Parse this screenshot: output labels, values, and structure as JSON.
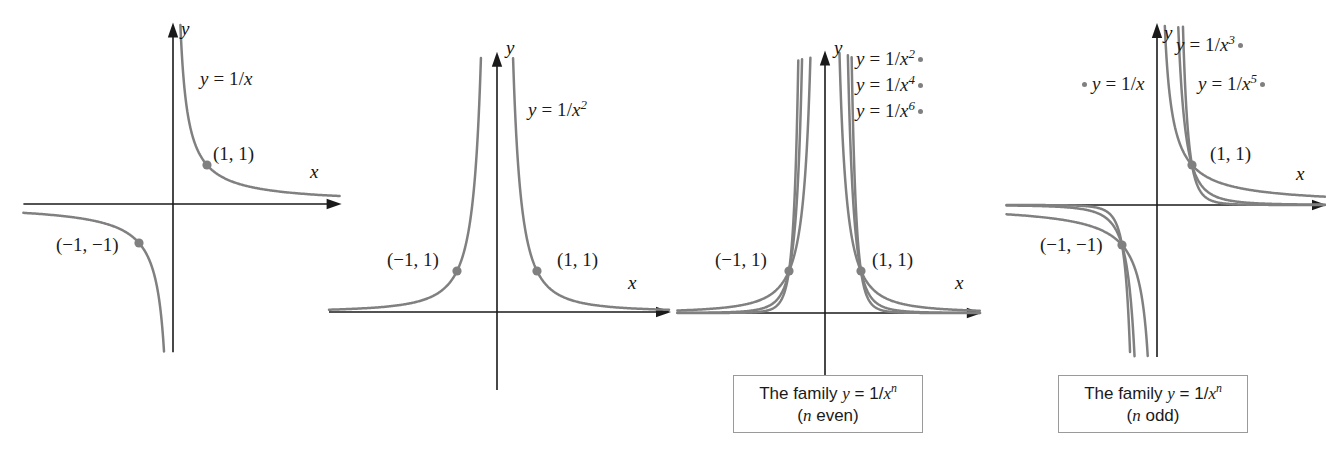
{
  "figure": {
    "background_color": "#ffffff",
    "curve_color": "#808080",
    "axis_color": "#1a1a1a",
    "point_color": "#808080",
    "caption_border_color": "#9a9a9a"
  },
  "chart_data": {
    "type": "line",
    "panels": [
      {
        "id": "panel-1",
        "xlabel": "x",
        "ylabel": "y",
        "grid": false,
        "legend_position": "inside-upper-right",
        "origin": {
          "x": 173,
          "y": 204
        },
        "scale": {
          "x": 34,
          "y": 39
        },
        "xlim": [
          -4.4,
          4.9
        ],
        "ylim": [
          -3.8,
          4.6
        ],
        "curve_labels": [
          {
            "text_html": "<span class=\"var\">y</span> = 1/<span class=\"var\">x</span>",
            "left": 200,
            "top": 68,
            "marker": "none"
          }
        ],
        "points": [
          {
            "label": "(1, 1)",
            "x": 1,
            "y": 1,
            "label_left": 213,
            "label_top": 143
          },
          {
            "label": "(−1, −1)",
            "x": -1,
            "y": -1,
            "label_left": 56,
            "label_top": 234
          }
        ],
        "series": [
          {
            "name": "y = 1/x",
            "exponent": 1,
            "odd": true
          }
        ]
      },
      {
        "id": "panel-2",
        "xlabel": "x",
        "ylabel": "y",
        "grid": false,
        "legend_position": "inside-upper-right",
        "origin": {
          "x": 497,
          "y": 312
        },
        "scale": {
          "x": 40,
          "y": 41
        },
        "xlim": [
          -4.2,
          4.3
        ],
        "ylim": [
          -1.9,
          6.3
        ],
        "curve_labels": [
          {
            "text_html": "<span class=\"var\">y</span> = 1/<span class=\"var\">x</span><sup>2</sup>",
            "left": 528,
            "top": 99,
            "marker": "none"
          }
        ],
        "points": [
          {
            "label": "(1, 1)",
            "x": 1,
            "y": 1,
            "label_left": 557,
            "label_top": 249
          },
          {
            "label": "(−1, 1)",
            "x": -1,
            "y": 1,
            "label_left": 387,
            "label_top": 249
          }
        ],
        "series": [
          {
            "name": "y = 1/x^2",
            "exponent": 2,
            "odd": false
          }
        ]
      },
      {
        "id": "panel-3",
        "xlabel": "x",
        "ylabel": "y",
        "grid": false,
        "legend_position": "upper-right",
        "origin": {
          "x": 825,
          "y": 313
        },
        "scale": {
          "x": 36,
          "y": 42
        },
        "xlim": [
          -4.1,
          4.3
        ],
        "ylim": [
          -1.9,
          6.2
        ],
        "curve_labels": [
          {
            "text_html": "<span class=\"var\">y</span> = 1/<span class=\"var\">x</span><sup>2</sup>",
            "left": 856,
            "top": 48,
            "marker": "trailing"
          },
          {
            "text_html": "<span class=\"var\">y</span> = 1/<span class=\"var\">x</span><sup>4</sup>",
            "left": 856,
            "top": 74,
            "marker": "trailing"
          },
          {
            "text_html": "<span class=\"var\">y</span> = 1/<span class=\"var\">x</span><sup>6</sup>",
            "left": 856,
            "top": 100,
            "marker": "trailing"
          }
        ],
        "points": [
          {
            "label": "(1, 1)",
            "x": 1,
            "y": 1,
            "label_left": 872,
            "label_top": 249
          },
          {
            "label": "(−1, 1)",
            "x": -1,
            "y": 1,
            "label_left": 715,
            "label_top": 249
          }
        ],
        "series": [
          {
            "name": "y = 1/x^2",
            "exponent": 2,
            "odd": false
          },
          {
            "name": "y = 1/x^4",
            "exponent": 4,
            "odd": false
          },
          {
            "name": "y = 1/x^6",
            "exponent": 6,
            "odd": false
          }
        ],
        "caption": {
          "line1_html": "The family <span class=\"var\">y</span> = 1/<span class=\"var\">x</span><sup>n</sup>",
          "line2_html": "(<span class=\"var\">n</span> even)",
          "left": 733,
          "top": 375,
          "width": 190,
          "height": 58
        }
      },
      {
        "id": "panel-4",
        "xlabel": "x",
        "ylabel": "y",
        "grid": false,
        "legend_position": "upper-area",
        "origin": {
          "x": 1157,
          "y": 205
        },
        "scale": {
          "x": 35,
          "y": 40
        },
        "xlim": [
          -4.3,
          4.8
        ],
        "ylim": [
          -3.8,
          4.5
        ],
        "curve_labels": [
          {
            "text_html": "<span class=\"var\">y</span> = 1/<span class=\"var\">x</span><sup>3</sup>",
            "left": 1176,
            "top": 34,
            "marker": "trailing"
          },
          {
            "text_html": "<span class=\"var\">y</span> = 1/<span class=\"var\">x</span><sup>5</sup>",
            "left": 1198,
            "top": 73,
            "marker": "trailing"
          },
          {
            "text_html": "<span class=\"var\">y</span> = 1/<span class=\"var\">x</span>",
            "left": 1082,
            "top": 73,
            "marker": "leading"
          }
        ],
        "points": [
          {
            "label": "(1, 1)",
            "x": 1,
            "y": 1,
            "label_left": 1210,
            "label_top": 143
          },
          {
            "label": "(−1, −1)",
            "x": -1,
            "y": -1,
            "label_left": 1040,
            "label_top": 234
          }
        ],
        "series": [
          {
            "name": "y = 1/x",
            "exponent": 1,
            "odd": true
          },
          {
            "name": "y = 1/x^3",
            "exponent": 3,
            "odd": true
          },
          {
            "name": "y = 1/x^5",
            "exponent": 5,
            "odd": true
          }
        ],
        "caption": {
          "line1_html": "The family <span class=\"var\">y</span> = 1/<span class=\"var\">x</span><sup>n</sup>",
          "line2_html": "(<span class=\"var\">n</span> odd)",
          "left": 1058,
          "top": 375,
          "width": 190,
          "height": 58
        }
      }
    ],
    "axis_letters": [
      {
        "panel": "panel-1",
        "text": "y",
        "left": 181,
        "top": 18
      },
      {
        "panel": "panel-1",
        "text": "x",
        "left": 310,
        "top": 161
      },
      {
        "panel": "panel-2",
        "text": "y",
        "left": 506,
        "top": 37
      },
      {
        "panel": "panel-2",
        "text": "x",
        "left": 628,
        "top": 272
      },
      {
        "panel": "panel-3",
        "text": "y",
        "left": 834,
        "top": 37
      },
      {
        "panel": "panel-3",
        "text": "x",
        "left": 955,
        "top": 272
      },
      {
        "panel": "panel-4",
        "text": "y",
        "left": 1164,
        "top": 22
      },
      {
        "panel": "panel-4",
        "text": "x",
        "left": 1296,
        "top": 163
      }
    ]
  }
}
